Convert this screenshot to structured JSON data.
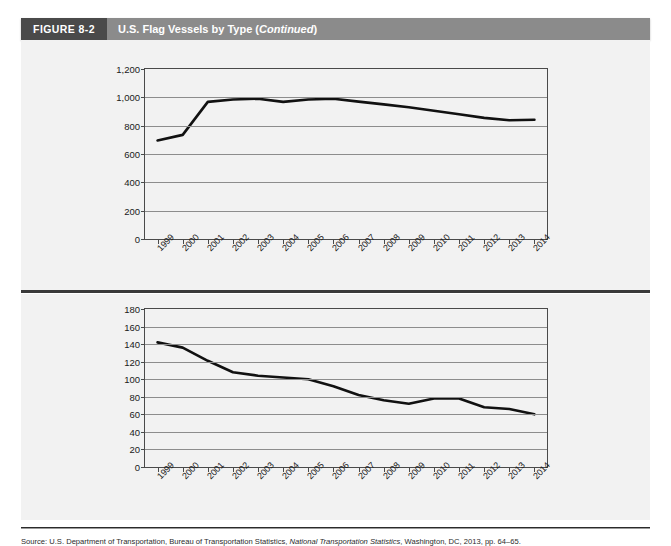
{
  "figure": {
    "tag": "FIGURE 8-2",
    "caption_main": "U.S. Flag Vessels by Type (",
    "caption_italic": "Continued",
    "caption_close": ")"
  },
  "source": {
    "prefix": "Source: U.S. Department of Transportation, Bureau of Transportation Statistics, ",
    "italic_title": "National Transportation Statistics",
    "suffix": ", Washington, DC, 2013, pp. 64–65."
  },
  "chart_data": [
    {
      "type": "line",
      "name": "upper-chart",
      "title": "",
      "xlabel": "",
      "ylabel": "",
      "categories": [
        "1999",
        "2000",
        "2001",
        "2002",
        "2003",
        "2004",
        "2005",
        "2006",
        "2007",
        "2008",
        "2009",
        "2010",
        "2011",
        "2012",
        "2013",
        "2014"
      ],
      "values": [
        695,
        735,
        968,
        985,
        990,
        968,
        985,
        990,
        970,
        950,
        930,
        905,
        880,
        855,
        838,
        842
      ],
      "ylim": [
        0,
        1200
      ],
      "yticks": [
        0,
        200,
        400,
        600,
        800,
        1000,
        1200
      ],
      "ytick_labels": [
        "0",
        "200",
        "400",
        "600",
        "800",
        "1,000",
        "1,200"
      ],
      "grid": true,
      "legend": "none"
    },
    {
      "type": "line",
      "name": "lower-chart",
      "title": "",
      "xlabel": "",
      "ylabel": "",
      "categories": [
        "1999",
        "2000",
        "2001",
        "2002",
        "2003",
        "2004",
        "2005",
        "2006",
        "2007",
        "2008",
        "2009",
        "2010",
        "2011",
        "2012",
        "2013",
        "2014"
      ],
      "values": [
        142,
        136,
        121,
        108,
        104,
        102,
        100,
        92,
        82,
        76,
        72,
        78,
        78,
        68,
        66,
        60
      ],
      "ylim": [
        0,
        180
      ],
      "yticks": [
        0,
        20,
        40,
        60,
        80,
        100,
        120,
        140,
        160,
        180
      ],
      "ytick_labels": [
        "0",
        "20",
        "40",
        "60",
        "80",
        "100",
        "120",
        "140",
        "160",
        "180"
      ],
      "grid": true,
      "legend": "none"
    }
  ]
}
